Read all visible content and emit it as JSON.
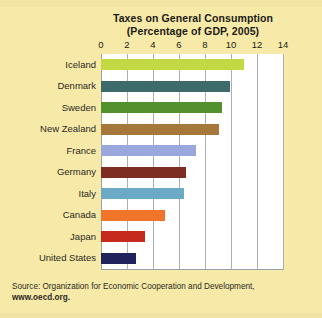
{
  "chart_data": {
    "type": "bar",
    "orientation": "horizontal",
    "title": "Taxes on General Consumption",
    "subtitle": "(Percentage of GDP, 2005)",
    "xlabel": "",
    "ylabel": "",
    "xlim": [
      0,
      14
    ],
    "grid": true,
    "legend": "none",
    "ticks": [
      0,
      2,
      4,
      6,
      8,
      10,
      12,
      14
    ],
    "tick_labels": [
      "0",
      "2",
      "4",
      "6",
      "8",
      "10",
      "12",
      "14"
    ],
    "categories": [
      "Iceland",
      "Denmark",
      "Sweden",
      "New Zealand",
      "France",
      "Germany",
      "Italy",
      "Canada",
      "Japan",
      "United States"
    ],
    "values": [
      11.0,
      9.9,
      9.3,
      9.1,
      7.3,
      6.5,
      6.4,
      4.9,
      3.4,
      2.7
    ],
    "bar_colors": [
      "#c3d944",
      "#3d6a6b",
      "#53912f",
      "#a5773a",
      "#9aa6de",
      "#7e2d23",
      "#6aaac4",
      "#f0742a",
      "#c62a1d",
      "#20235c"
    ],
    "plot_background": "#ffffff",
    "figure_background": "#f7e9a8",
    "gridline_color": "#aab0b5"
  },
  "source": {
    "line1": "Source: Organization for Economic Cooperation and Development,",
    "line2": "www.oecd.org."
  }
}
